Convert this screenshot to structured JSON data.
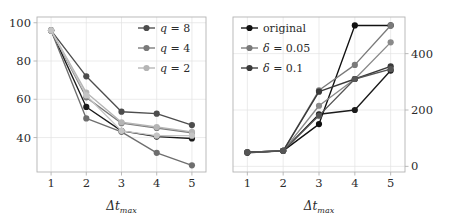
{
  "figure": {
    "panels": [
      "left",
      "right"
    ],
    "background_color": "#ffffff",
    "frame_color": "#b3b3b3"
  },
  "chart_data": [
    {
      "type": "line",
      "panel": "left",
      "title": "",
      "xlabel": "Δt_max",
      "xlabel_main": "Δt",
      "xlabel_sub": "max",
      "ylabel": "",
      "x": [
        1,
        2,
        3,
        4,
        5
      ],
      "xticks": [
        "1",
        "2",
        "3",
        "4",
        "5"
      ],
      "yticks": [
        "40",
        "60",
        "80",
        "100"
      ],
      "ytick_values": [
        40,
        60,
        80,
        100
      ],
      "xlim": [
        0.6,
        5.4
      ],
      "ylim": [
        22,
        103
      ],
      "grid": true,
      "legend_position": "top-right",
      "legend": [
        "q = 8",
        "q = 4",
        "q = 2"
      ],
      "legend_colors": [
        "#4d4d4d",
        "#7a7a7a",
        "#b5b5b5"
      ],
      "series": [
        {
          "name": "q = 8 (a)",
          "color": "#4d4d4d",
          "values": [
            96,
            72,
            53.5,
            52.5,
            46.5
          ]
        },
        {
          "name": "q = 8 (b)",
          "color": "#1a1a1a",
          "values": [
            96,
            56,
            43.5,
            40.5,
            39.5
          ]
        },
        {
          "name": "q = 4 (a)",
          "color": "#7a7a7a",
          "values": [
            96,
            61,
            47.5,
            45,
            42.5
          ]
        },
        {
          "name": "q = 4 (b)",
          "color": "#6e6e6e",
          "values": [
            96,
            50,
            43,
            32,
            25.5
          ]
        },
        {
          "name": "q = 2 (a)",
          "color": "#b5b5b5",
          "values": [
            96,
            63.5,
            48,
            45.5,
            43
          ]
        },
        {
          "name": "q = 2 (b)",
          "color": "#c4c4c4",
          "values": [
            96,
            62,
            43.5,
            41,
            41
          ]
        }
      ]
    },
    {
      "type": "line",
      "panel": "right",
      "title": "",
      "xlabel": "Δt_max",
      "xlabel_main": "Δt",
      "xlabel_sub": "max",
      "ylabel": "",
      "yaxis_side": "right",
      "x": [
        1,
        2,
        3,
        4,
        5
      ],
      "xticks": [
        "1",
        "2",
        "3",
        "4",
        "5"
      ],
      "yticks": [
        "0",
        "200",
        "400"
      ],
      "ytick_values": [
        0,
        200,
        400
      ],
      "xlim": [
        0.6,
        5.4
      ],
      "ylim": [
        -20,
        530
      ],
      "grid": true,
      "legend_position": "top-left",
      "legend": [
        "original",
        "δ = 0.05",
        "δ = 0.1"
      ],
      "legend_colors": [
        "#111111",
        "#7a7a7a",
        "#3a3a3a"
      ],
      "series": [
        {
          "name": "original (a)",
          "color": "#111111",
          "values": [
            50,
            55,
            150,
            500,
            500
          ]
        },
        {
          "name": "original (b)",
          "color": "#1a1a1a",
          "values": [
            48,
            55,
            185,
            200,
            340
          ]
        },
        {
          "name": "delta 0.05 (a)",
          "color": "#7a7a7a",
          "values": [
            50,
            55,
            270,
            360,
            500
          ]
        },
        {
          "name": "delta 0.05 (b)",
          "color": "#8a8a8a",
          "values": [
            50,
            55,
            215,
            310,
            440
          ]
        },
        {
          "name": "delta 0.1 (a)",
          "color": "#3a3a3a",
          "values": [
            50,
            55,
            265,
            310,
            355
          ]
        },
        {
          "name": "delta 0.1 (b)",
          "color": "#555555",
          "values": [
            50,
            55,
            180,
            310,
            345
          ]
        }
      ]
    }
  ]
}
